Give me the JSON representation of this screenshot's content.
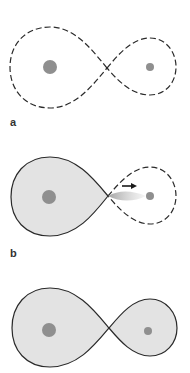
{
  "figure": {
    "panels": [
      {
        "label": "a",
        "state": "detached",
        "left_lobe": "dashed-empty",
        "right_lobe": "dashed-empty"
      },
      {
        "label": "b",
        "state": "semi-detached-mass-transfer",
        "left_lobe": "filled-solid",
        "right_lobe": "dashed-empty",
        "annotation": "arrow-mass-transfer"
      },
      {
        "label": "c",
        "state": "contact",
        "left_lobe": "filled-solid",
        "right_lobe": "filled-solid"
      }
    ]
  },
  "colors": {
    "outline": "#2a2a2a",
    "fill": "#e3e3e3",
    "star": "#8f8f8f",
    "stream": "#b5b5b5",
    "label": "#333333"
  }
}
